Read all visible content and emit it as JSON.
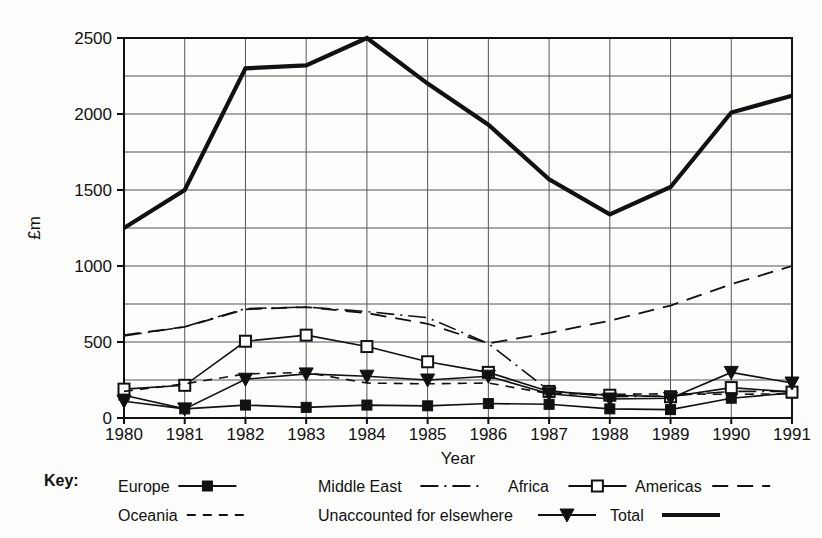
{
  "chart_data": {
    "type": "line",
    "title": "",
    "xlabel": "Year",
    "ylabel": "£m",
    "categories": [
      "1980",
      "1981",
      "1982",
      "1983",
      "1984",
      "1985",
      "1986",
      "1987",
      "1988",
      "1989",
      "1990",
      "1991"
    ],
    "x": [
      1980,
      1981,
      1982,
      1983,
      1984,
      1985,
      1986,
      1987,
      1988,
      1989,
      1990,
      1991
    ],
    "ylim": [
      0,
      2500
    ],
    "xlim": [
      1980,
      1991
    ],
    "y_ticks_labeled": [
      0,
      500,
      1000,
      1500,
      2000,
      2500
    ],
    "y_gridlines": [
      0,
      250,
      500,
      750,
      1000,
      1250,
      1500,
      1750,
      2000,
      2250,
      2500
    ],
    "grid": true,
    "legend_position": "below-plot",
    "series": [
      {
        "name": "Europe",
        "marker": "filled-square",
        "dash": "solid",
        "width": 1.6,
        "values": [
          150,
          60,
          85,
          70,
          85,
          80,
          95,
          90,
          60,
          55,
          130,
          165
        ]
      },
      {
        "name": "Middle East",
        "marker": "none",
        "dash": "dash-dot",
        "width": 1.6,
        "values": [
          540,
          600,
          720,
          730,
          700,
          660,
          490,
          180,
          140,
          145,
          175,
          175
        ]
      },
      {
        "name": "Africa",
        "marker": "open-square",
        "dash": "solid",
        "width": 1.6,
        "values": [
          190,
          215,
          505,
          545,
          470,
          370,
          300,
          175,
          150,
          140,
          200,
          170
        ]
      },
      {
        "name": "Americas",
        "marker": "none",
        "dash": "long-dash",
        "width": 1.8,
        "values": [
          545,
          600,
          715,
          730,
          690,
          620,
          490,
          560,
          640,
          740,
          880,
          1000
        ]
      },
      {
        "name": "Oceania",
        "marker": "none",
        "dash": "dashed",
        "width": 1.6,
        "values": [
          175,
          225,
          290,
          300,
          230,
          225,
          230,
          160,
          155,
          160,
          155,
          160
        ]
      },
      {
        "name": "Unaccounted for elsewhere",
        "marker": "filled-triangle",
        "dash": "solid",
        "width": 1.6,
        "values": [
          110,
          60,
          255,
          290,
          275,
          250,
          275,
          160,
          125,
          130,
          300,
          230
        ]
      },
      {
        "name": "Total",
        "marker": "none",
        "dash": "solid",
        "width": 4.2,
        "values": [
          1250,
          1500,
          2300,
          2320,
          2500,
          2200,
          1930,
          1570,
          1340,
          1520,
          2010,
          2120
        ]
      }
    ]
  },
  "legend": {
    "key_label": "Key:",
    "rows": [
      [
        {
          "label": "Europe",
          "series": "Europe"
        },
        {
          "label": "Middle East",
          "series": "Middle East"
        },
        {
          "label": "Africa",
          "series": "Africa"
        },
        {
          "label": "Americas",
          "series": "Americas"
        }
      ],
      [
        {
          "label": "Oceania",
          "series": "Oceania"
        },
        {
          "label": "Unaccounted for elsewhere",
          "series": "Unaccounted for elsewhere"
        },
        {
          "label": "Total",
          "series": "Total"
        }
      ]
    ]
  },
  "colors": {
    "ink": "#111111",
    "grid": "#555555",
    "background": "#fdfdfb"
  }
}
